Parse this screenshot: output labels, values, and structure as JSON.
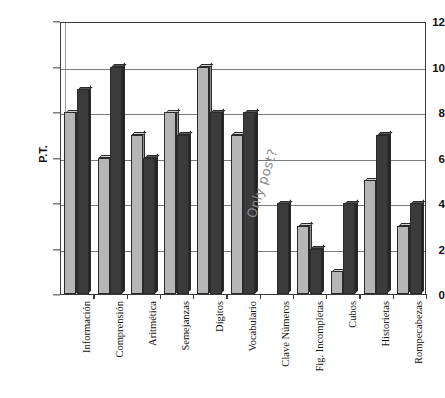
{
  "chart_data": {
    "type": "bar",
    "title": "",
    "xlabel": "",
    "ylabel": "P.T.",
    "ylim": [
      0,
      12
    ],
    "ytick_step": 2,
    "yticks": [
      0,
      2,
      4,
      6,
      8,
      10,
      12
    ],
    "grid": true,
    "legend": null,
    "categories": [
      "Información",
      "Comprensión",
      "Aritmética",
      "Semejanzas",
      "Dígitos",
      "Vocabulario",
      "Clave Números",
      "Fig. Incompletas",
      "Cubos",
      "Historietas",
      "Rompecabezas"
    ],
    "series": [
      {
        "name": "pre",
        "color": "#b6b6b6",
        "values": [
          8,
          6,
          7,
          8,
          10,
          7,
          0,
          3,
          1,
          5,
          3
        ]
      },
      {
        "name": "post",
        "color": "#3b3b3b",
        "values": [
          9,
          10,
          6,
          7,
          8,
          8,
          4,
          2,
          4,
          7,
          4
        ]
      }
    ],
    "annotations": [
      {
        "text": "Only post?",
        "kind": "handwritten-note",
        "rotation_deg": -72,
        "color": "#8a8a8a"
      }
    ]
  },
  "axis": {
    "y_title": "P.T.",
    "y_tick_labels": [
      "0",
      "2",
      "4",
      "6",
      "8",
      "10",
      "12"
    ]
  }
}
